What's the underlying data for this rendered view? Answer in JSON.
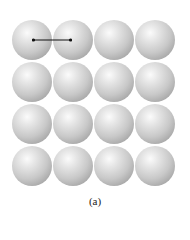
{
  "figure": {
    "caption": "(a)",
    "lattice": {
      "rows": 4,
      "cols": 4,
      "type": "simple-square"
    },
    "arrow": {
      "from": "sphere-center-row1-col1",
      "to": "sphere-center-row1-col2",
      "meaning": "lattice spacing"
    }
  }
}
